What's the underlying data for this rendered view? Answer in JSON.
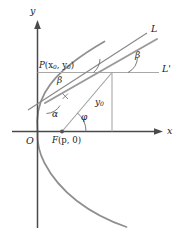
{
  "figure": {
    "kind": "geometry-diagram",
    "width": 183,
    "height": 240,
    "background_color": "#ffffff"
  },
  "colors": {
    "axis": "#4a4a4a",
    "curve": "#8f8f8f",
    "ray": "#9a9a9a",
    "tangent": "#8a8a8a",
    "guide": "#a8a8a8",
    "arc": "#6e6e6e",
    "text": "#1a1a1a",
    "point_fill": "#555555"
  },
  "axes": {
    "x_label": "x",
    "y_label": "y",
    "origin_label": "O",
    "x_axis_y": 131.5,
    "y_axis_x": 37.5,
    "x_axis_start": 12,
    "x_axis_end": 163,
    "y_axis_top": 20,
    "y_axis_bottom": 228
  },
  "points": [
    {
      "name": "origin",
      "label": "O",
      "label_plain": "O",
      "x": 37.5,
      "y": 131.5,
      "label_x": 26,
      "label_y": 136,
      "marker": false
    },
    {
      "name": "focus",
      "label_main": "F",
      "label_args": "(p, 0)",
      "label_plain": "F(p, 0)",
      "x": 62,
      "y": 131.5,
      "label_x": 52,
      "label_y": 136,
      "marker": true
    },
    {
      "name": "point-p",
      "label_main": "P",
      "label_args": "(x0, y0)",
      "label_plain": "P(x0, y0)",
      "x": 112,
      "y": 72.5,
      "label_x": 39,
      "label_y": 61,
      "marker": false
    }
  ],
  "lines": [
    {
      "name": "tangent-line",
      "label": "L",
      "label_plain": "L",
      "label_x": 151,
      "label_y": 24,
      "x1": 28,
      "y1": 110,
      "x2": 147,
      "y2": 33
    },
    {
      "name": "horizontal-line",
      "label": "L'",
      "label_plain": "L'",
      "label_x": 162,
      "label_y": 64,
      "x1": 37.5,
      "y1": 72.5,
      "x2": 159,
      "y2": 72.5
    },
    {
      "name": "reflected-ray",
      "label_plain": "",
      "x1": 45,
      "y1": 103,
      "x2": 157,
      "y2": 39
    },
    {
      "name": "focal-radius",
      "label_plain": "",
      "x1": 62,
      "y1": 131.5,
      "x2": 112,
      "y2": 72.5
    },
    {
      "name": "ordinate-segment",
      "label": "y0",
      "label_plain": "y0",
      "label_x": 95,
      "label_y": 98,
      "x1": 112,
      "y1": 72.5,
      "x2": 112,
      "y2": 131.5
    },
    {
      "name": "directrix-perpendicular",
      "label_plain": "",
      "x1": 37.5,
      "y1": 72.5,
      "x2": 112,
      "y2": 72.5
    }
  ],
  "angles": [
    {
      "name": "angle-alpha",
      "label": "α",
      "label_plain": "alpha",
      "label_x": 52,
      "label_y": 110,
      "vertex": "tangent-intersection",
      "description": "angle between tangent line and focal chord"
    },
    {
      "name": "angle-beta-at-p",
      "label": "β",
      "label_plain": "beta",
      "label_x": 57,
      "label_y": 76,
      "vertex": "point-p",
      "description": "angle at P between horizontal and tangent"
    },
    {
      "name": "angle-beta-at-right",
      "label": "β",
      "label_plain": "beta",
      "label_x": 135,
      "label_y": 51,
      "vertex": "right-intersection",
      "description": "angle between line L and line L prime"
    },
    {
      "name": "angle-phi",
      "label": "φ",
      "label_plain": "phi",
      "label_x": 81,
      "label_y": 113,
      "vertex": "focus",
      "description": "polar angle at focus F"
    }
  ],
  "curve": {
    "name": "parabola",
    "description": "rightward-opening parabola with vertex at origin",
    "vertex_x": 37.5,
    "vertex_y": 131.5,
    "color": "#8f8f8f"
  }
}
